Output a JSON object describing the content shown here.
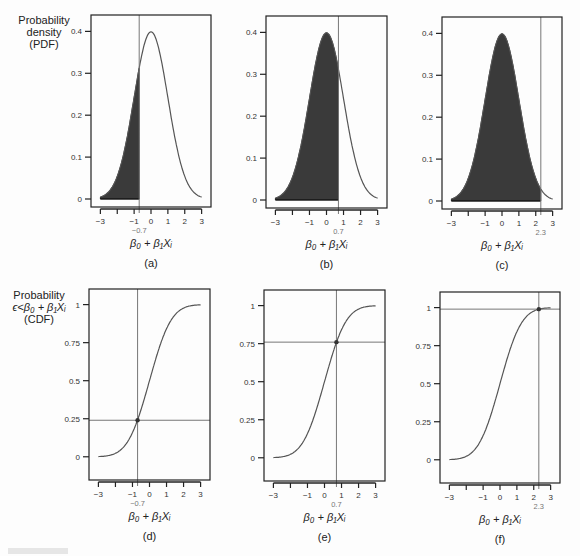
{
  "figure": {
    "row_ylabels": [
      {
        "lines": [
          "Probability",
          "density",
          "(PDF)"
        ]
      },
      {
        "lines": [
          "Probability",
          "ϵ<β₀ + β₁Xᵢ",
          "(CDF)"
        ]
      }
    ],
    "xlabel": "β₀ + β₁Xᵢ",
    "colors": {
      "fill": "#3a3a3a",
      "curve": "#555555",
      "frame": "#222222",
      "guide": "#777777",
      "highlight_label": "#777777"
    }
  },
  "chart_data": [
    {
      "panel": "(a)",
      "type": "area",
      "curve": "normal_pdf",
      "title": "",
      "xlabel": "β₀ + β₁Xᵢ",
      "ylabel": "Probability density (PDF)",
      "xlim": [
        -3.2,
        3.2
      ],
      "ylim": [
        0,
        0.42
      ],
      "yticks": [
        0,
        0.1,
        0.2,
        0.3,
        0.4
      ],
      "ytick_labels": [
        "0",
        "0.1",
        "0.2",
        "0.3",
        "0.4"
      ],
      "xticks": [
        -3,
        -2,
        -1,
        0,
        1,
        2,
        3
      ],
      "xtick_labels": [
        "−3",
        "",
        "−1",
        "0",
        "1",
        "2",
        "3"
      ],
      "cutoff": -0.7,
      "cutoff_label": "−0.7",
      "shaded": "left of cutoff",
      "shaded_area": 0.24
    },
    {
      "panel": "(b)",
      "type": "area",
      "curve": "normal_pdf",
      "title": "",
      "xlabel": "β₀ + β₁Xᵢ",
      "ylabel": "",
      "xlim": [
        -3.2,
        3.2
      ],
      "ylim": [
        0,
        0.42
      ],
      "yticks": [
        0,
        0.1,
        0.2,
        0.3,
        0.4
      ],
      "ytick_labels": [
        "0",
        "0.1",
        "0.2",
        "0.3",
        "0.4"
      ],
      "xticks": [
        -3,
        -2,
        -1,
        0,
        1,
        2,
        3
      ],
      "xtick_labels": [
        "−3",
        "",
        "−1",
        "0",
        "1",
        "2",
        "3"
      ],
      "cutoff": 0.7,
      "cutoff_label": "0.7",
      "shaded": "left of cutoff",
      "shaded_area": 0.76
    },
    {
      "panel": "(c)",
      "type": "area",
      "curve": "normal_pdf",
      "title": "",
      "xlabel": "β₀ + β₁Xᵢ",
      "ylabel": "",
      "xlim": [
        -3.2,
        3.2
      ],
      "ylim": [
        0,
        0.42
      ],
      "yticks": [
        0,
        0.1,
        0.2,
        0.3,
        0.4
      ],
      "ytick_labels": [
        "0",
        "0.1",
        "0.2",
        "0.3",
        "0.4"
      ],
      "xticks": [
        -3,
        -2,
        -1,
        0,
        1,
        2,
        3
      ],
      "xtick_labels": [
        "−3",
        "",
        "−1",
        "0",
        "1",
        "2",
        "3"
      ],
      "cutoff": 2.3,
      "cutoff_label": "2.3",
      "shaded": "left of cutoff",
      "shaded_area": 0.99
    },
    {
      "panel": "(d)",
      "type": "line",
      "curve": "normal_cdf",
      "title": "",
      "xlabel": "β₀ + β₁Xᵢ",
      "ylabel": "Probability ϵ<β₀ + β₁Xᵢ (CDF)",
      "xlim": [
        -3.2,
        3.2
      ],
      "ylim": [
        -0.1,
        1.05
      ],
      "yticks": [
        0,
        0.25,
        0.5,
        0.75,
        1
      ],
      "ytick_labels": [
        "0",
        "0.25",
        "0.5",
        "0.75",
        "1"
      ],
      "xticks": [
        -3,
        -2,
        -1,
        0,
        1,
        2,
        3
      ],
      "xtick_labels": [
        "−3",
        "",
        "−1",
        "0",
        "1",
        "2",
        "3"
      ],
      "cutoff": -0.7,
      "cutoff_label": "−0.7",
      "point": [
        -0.7,
        0.24
      ]
    },
    {
      "panel": "(e)",
      "type": "line",
      "curve": "normal_cdf",
      "title": "",
      "xlabel": "β₀ + β₁Xᵢ",
      "ylabel": "",
      "xlim": [
        -3.2,
        3.2
      ],
      "ylim": [
        -0.1,
        1.05
      ],
      "yticks": [
        0,
        0.25,
        0.5,
        0.75,
        1
      ],
      "ytick_labels": [
        "0",
        "0.25",
        "0.5",
        "0.75",
        "1"
      ],
      "xticks": [
        -3,
        -2,
        -1,
        0,
        1,
        2,
        3
      ],
      "xtick_labels": [
        "−3",
        "",
        "−1",
        "0",
        "1",
        "2",
        "3"
      ],
      "cutoff": 0.7,
      "cutoff_label": "0.7",
      "point": [
        0.7,
        0.76
      ]
    },
    {
      "panel": "(f)",
      "type": "line",
      "curve": "normal_cdf",
      "title": "",
      "xlabel": "β₀ + β₁Xᵢ",
      "ylabel": "",
      "xlim": [
        -3.2,
        3.2
      ],
      "ylim": [
        -0.1,
        1.05
      ],
      "yticks": [
        0,
        0.25,
        0.5,
        0.75,
        1
      ],
      "ytick_labels": [
        "0",
        "0.25",
        "0.5",
        "0.75",
        "1"
      ],
      "xticks": [
        -3,
        -2,
        -1,
        0,
        1,
        2,
        3
      ],
      "xtick_labels": [
        "−3",
        "",
        "−1",
        "0",
        "1",
        "2",
        "3"
      ],
      "cutoff": 2.3,
      "cutoff_label": "2.3",
      "point": [
        2.3,
        0.99
      ]
    }
  ],
  "layout": {
    "panels": [
      {
        "left": 91,
        "top": 15,
        "right": 211,
        "bottom": 207
      },
      {
        "left": 266,
        "top": 16,
        "right": 387,
        "bottom": 208
      },
      {
        "left": 442,
        "top": 17,
        "right": 562,
        "bottom": 209
      },
      {
        "left": 89,
        "top": 289,
        "right": 210,
        "bottom": 480
      },
      {
        "left": 264,
        "top": 290,
        "right": 385,
        "bottom": 481
      },
      {
        "left": 440,
        "top": 292,
        "right": 560,
        "bottom": 483
      }
    ]
  }
}
